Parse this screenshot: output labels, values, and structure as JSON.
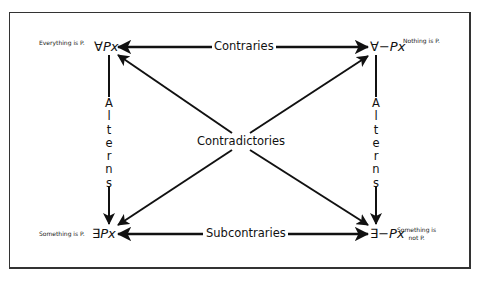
{
  "diagram": {
    "corners": {
      "top_left": {
        "formula_quantifier": "∀",
        "formula_body": "Px",
        "note": "Everything is P."
      },
      "top_right": {
        "formula_quantifier": "∀−",
        "formula_body": "Px",
        "note": "Nothing is P."
      },
      "bottom_left": {
        "formula_quantifier": "∃",
        "formula_body": "Px",
        "note": "Something is P."
      },
      "bottom_right": {
        "formula_quantifier": "∃−",
        "formula_body": "Px",
        "note_line1": "Something is",
        "note_line2": "not P."
      }
    },
    "relations": {
      "top": "Contraries",
      "bottom": "Subcontraries",
      "center": "Contradictories",
      "left_vertical": [
        "A",
        "l",
        "t",
        "e",
        "r",
        "n",
        "s"
      ],
      "right_vertical": [
        "A",
        "l",
        "t",
        "e",
        "r",
        "n",
        "s"
      ]
    },
    "colors": {
      "line": "#111111",
      "frame": "#333333",
      "background": "#ffffff"
    }
  }
}
